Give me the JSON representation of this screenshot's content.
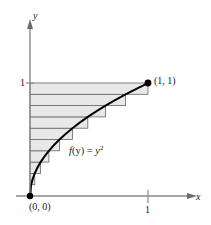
{
  "figure": {
    "name": "area-under-curve-horizontal-rectangles",
    "background_color": "#ffffff"
  },
  "axes": {
    "x_label": "x",
    "y_label": "y",
    "x_ticks": [
      {
        "value": 1,
        "label": "1"
      }
    ],
    "y_ticks": [
      {
        "value": 1,
        "label": "1"
      }
    ],
    "axis_color": "#8a8a8a",
    "xlim": [
      0,
      1.28
    ],
    "ylim": [
      0,
      1.35
    ]
  },
  "labels": {
    "origin_point": "(0, 0)",
    "end_point": "(1, 1)",
    "function_lead": "f",
    "function_arg": "(y) = ",
    "function_base": "y",
    "function_exponent": "2",
    "function_full": "f(y) = y²"
  },
  "chart_data": {
    "type": "area",
    "title": "",
    "subtitle": "",
    "xlabel": "x",
    "ylabel": "y",
    "xlim": [
      0,
      1.28
    ],
    "ylim": [
      0,
      1.35
    ],
    "grid": false,
    "legend": "none",
    "curve": {
      "name": "f(y) = y²",
      "equation": "x = y^2",
      "description": "curve of f(y)=y squared drawn from (0,0) to (1,1)",
      "color": "#000000",
      "line_width": 2.0,
      "points": [
        {
          "x": 0.0,
          "y": 0.0
        },
        {
          "x": 0.01,
          "y": 0.1
        },
        {
          "x": 0.04,
          "y": 0.2
        },
        {
          "x": 0.09,
          "y": 0.3
        },
        {
          "x": 0.16,
          "y": 0.4
        },
        {
          "x": 0.25,
          "y": 0.5
        },
        {
          "x": 0.36,
          "y": 0.6
        },
        {
          "x": 0.49,
          "y": 0.7
        },
        {
          "x": 0.64,
          "y": 0.8
        },
        {
          "x": 0.81,
          "y": 0.9
        },
        {
          "x": 1.0,
          "y": 1.0
        }
      ]
    },
    "rectangles": {
      "description": "10 horizontal rectangles of equal height approximating the region left of the curve, integrated with respect to y",
      "count": 10,
      "orientation": "horizontal",
      "fill_color": "#e8e8e8",
      "edge_color": "#666666",
      "dy": 0.1,
      "bands": [
        {
          "y_bottom": 0.0,
          "y_top": 0.1,
          "x_left": 0.0,
          "x_right": 0.01
        },
        {
          "y_bottom": 0.1,
          "y_top": 0.2,
          "x_left": 0.0,
          "x_right": 0.04
        },
        {
          "y_bottom": 0.2,
          "y_top": 0.3,
          "x_left": 0.0,
          "x_right": 0.09
        },
        {
          "y_bottom": 0.3,
          "y_top": 0.4,
          "x_left": 0.0,
          "x_right": 0.16
        },
        {
          "y_bottom": 0.4,
          "y_top": 0.5,
          "x_left": 0.0,
          "x_right": 0.25
        },
        {
          "y_bottom": 0.5,
          "y_top": 0.6,
          "x_left": 0.0,
          "x_right": 0.36
        },
        {
          "y_bottom": 0.6,
          "y_top": 0.7,
          "x_left": 0.0,
          "x_right": 0.49
        },
        {
          "y_bottom": 0.7,
          "y_top": 0.8,
          "x_left": 0.0,
          "x_right": 0.64
        },
        {
          "y_bottom": 0.8,
          "y_top": 0.9,
          "x_left": 0.0,
          "x_right": 0.81
        },
        {
          "y_bottom": 0.9,
          "y_top": 1.0,
          "x_left": 0.0,
          "x_right": 1.0
        }
      ]
    },
    "markers": [
      {
        "label": "(0, 0)",
        "x": 0.0,
        "y": 0.0,
        "color": "#000000"
      },
      {
        "label": "(1, 1)",
        "x": 1.0,
        "y": 1.0,
        "color": "#000000"
      }
    ],
    "annotations": [
      {
        "text": "f(y) = y²",
        "x": 0.42,
        "y": 0.45
      }
    ]
  }
}
